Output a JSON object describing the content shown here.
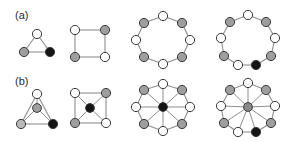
{
  "figure": {
    "width": 304,
    "height": 142,
    "background": "#ffffff",
    "row_labels": [
      {
        "id": "label-a",
        "text": "(a)"
      },
      {
        "id": "label-b",
        "text": "(b)"
      }
    ],
    "colors": {
      "node_white": "#ffffff",
      "node_gray": "#9e9e9e",
      "node_light_gray": "#b9b9b9",
      "node_black": "#151515",
      "hub_gray": "#8a8a8a",
      "edge": "#8e8e8e",
      "node_outline": "#3a3a3a",
      "label_text": "#2b2b2b"
    },
    "node_radius": 4.6,
    "hub_radius": 4.4
  },
  "panels": [
    {
      "name": "row-a-triangle",
      "row": "a",
      "index": 1,
      "graph_type": "cycle",
      "node_count": 3,
      "has_hub": false,
      "nodes": [
        {
          "id": "a1-n1",
          "x": 37,
          "y": 34,
          "fill": "node_white"
        },
        {
          "id": "a1-n2",
          "x": 24,
          "y": 52,
          "fill": "node_gray"
        },
        {
          "id": "a1-n3",
          "x": 50,
          "y": 52,
          "fill": "node_black"
        }
      ],
      "edges": [
        [
          0,
          1
        ],
        [
          1,
          2
        ],
        [
          2,
          0
        ]
      ]
    },
    {
      "name": "row-a-square",
      "row": "a",
      "index": 2,
      "graph_type": "cycle",
      "node_count": 4,
      "has_hub": false,
      "nodes": [
        {
          "id": "a2-n1",
          "x": 75,
          "y": 30,
          "fill": "node_white"
        },
        {
          "id": "a2-n2",
          "x": 105,
          "y": 30,
          "fill": "node_gray"
        },
        {
          "id": "a2-n3",
          "x": 105,
          "y": 57,
          "fill": "node_white"
        },
        {
          "id": "a2-n4",
          "x": 75,
          "y": 57,
          "fill": "node_gray"
        }
      ],
      "edges": [
        [
          0,
          1
        ],
        [
          1,
          2
        ],
        [
          2,
          3
        ],
        [
          3,
          0
        ]
      ]
    },
    {
      "name": "row-a-ring8",
      "row": "a",
      "index": 3,
      "graph_type": "cycle",
      "node_count": 8,
      "has_hub": false,
      "center": {
        "x": 163,
        "y": 40
      },
      "radius_x": 27,
      "radius_y": 24,
      "start_angle_deg": -90,
      "nodes": [
        {
          "id": "a3-n1",
          "x": 163,
          "y": 16,
          "fill": "node_white"
        },
        {
          "id": "a3-n2",
          "x": 182,
          "y": 23,
          "fill": "node_gray"
        },
        {
          "id": "a3-n3",
          "x": 190,
          "y": 40,
          "fill": "node_white"
        },
        {
          "id": "a3-n4",
          "x": 182,
          "y": 57,
          "fill": "node_gray"
        },
        {
          "id": "a3-n5",
          "x": 163,
          "y": 64,
          "fill": "node_white"
        },
        {
          "id": "a3-n6",
          "x": 144,
          "y": 57,
          "fill": "node_gray"
        },
        {
          "id": "a3-n7",
          "x": 136,
          "y": 40,
          "fill": "node_white"
        },
        {
          "id": "a3-n8",
          "x": 144,
          "y": 23,
          "fill": "node_gray"
        }
      ],
      "edges": [
        [
          0,
          1
        ],
        [
          1,
          2
        ],
        [
          2,
          3
        ],
        [
          3,
          4
        ],
        [
          4,
          5
        ],
        [
          5,
          6
        ],
        [
          6,
          7
        ],
        [
          7,
          0
        ]
      ]
    },
    {
      "name": "row-a-ring9",
      "row": "a",
      "index": 4,
      "graph_type": "cycle",
      "node_count": 9,
      "has_hub": false,
      "center": {
        "x": 248,
        "y": 40
      },
      "radius_x": 28,
      "radius_y": 25,
      "nodes": [
        {
          "id": "a4-n1",
          "x": 248,
          "y": 15,
          "fill": "node_white"
        },
        {
          "id": "a4-n2",
          "x": 266,
          "y": 22,
          "fill": "node_gray"
        },
        {
          "id": "a4-n3",
          "x": 275,
          "y": 38,
          "fill": "node_white"
        },
        {
          "id": "a4-n4",
          "x": 271,
          "y": 56,
          "fill": "node_gray"
        },
        {
          "id": "a4-n5",
          "x": 256,
          "y": 65,
          "fill": "node_black"
        },
        {
          "id": "a4-n6",
          "x": 238,
          "y": 65,
          "fill": "node_white"
        },
        {
          "id": "a4-n7",
          "x": 224,
          "y": 56,
          "fill": "node_gray"
        },
        {
          "id": "a4-n8",
          "x": 221,
          "y": 38,
          "fill": "node_white"
        },
        {
          "id": "a4-n9",
          "x": 230,
          "y": 22,
          "fill": "node_gray"
        }
      ],
      "edges": [
        [
          0,
          1
        ],
        [
          1,
          2
        ],
        [
          2,
          3
        ],
        [
          3,
          4
        ],
        [
          4,
          5
        ],
        [
          5,
          6
        ],
        [
          6,
          7
        ],
        [
          7,
          8
        ],
        [
          8,
          0
        ]
      ]
    },
    {
      "name": "row-b-triangle-hub",
      "row": "b",
      "index": 1,
      "graph_type": "wheel",
      "node_count": 3,
      "has_hub": true,
      "hub": {
        "id": "b1-hub",
        "x": 37,
        "y": 108,
        "fill": "node_gray"
      },
      "nodes": [
        {
          "id": "b1-n1",
          "x": 37,
          "y": 94,
          "fill": "node_white"
        },
        {
          "id": "b1-n2",
          "x": 21,
          "y": 124,
          "fill": "node_light_gray"
        },
        {
          "id": "b1-n3",
          "x": 53,
          "y": 124,
          "fill": "node_black"
        }
      ],
      "edges": [
        [
          0,
          1
        ],
        [
          1,
          2
        ],
        [
          2,
          0
        ]
      ]
    },
    {
      "name": "row-b-square-hub",
      "row": "b",
      "index": 2,
      "graph_type": "wheel",
      "node_count": 4,
      "has_hub": true,
      "hub": {
        "id": "b2-hub",
        "x": 90,
        "y": 108,
        "fill": "node_black"
      },
      "nodes": [
        {
          "id": "b2-n1",
          "x": 75,
          "y": 93,
          "fill": "node_white"
        },
        {
          "id": "b2-n2",
          "x": 106,
          "y": 93,
          "fill": "node_gray"
        },
        {
          "id": "b2-n3",
          "x": 106,
          "y": 123,
          "fill": "node_white"
        },
        {
          "id": "b2-n4",
          "x": 75,
          "y": 123,
          "fill": "node_gray"
        }
      ],
      "edges": [
        [
          0,
          1
        ],
        [
          1,
          2
        ],
        [
          2,
          3
        ],
        [
          3,
          0
        ]
      ]
    },
    {
      "name": "row-b-wheel8",
      "row": "b",
      "index": 3,
      "graph_type": "wheel",
      "node_count": 8,
      "has_hub": true,
      "hub": {
        "id": "b3-hub",
        "x": 163,
        "y": 107,
        "fill": "node_black"
      },
      "nodes": [
        {
          "id": "b3-n1",
          "x": 163,
          "y": 84,
          "fill": "node_white"
        },
        {
          "id": "b3-n2",
          "x": 182,
          "y": 90,
          "fill": "node_gray"
        },
        {
          "id": "b3-n3",
          "x": 190,
          "y": 107,
          "fill": "node_white"
        },
        {
          "id": "b3-n4",
          "x": 182,
          "y": 124,
          "fill": "node_gray"
        },
        {
          "id": "b3-n5",
          "x": 163,
          "y": 131,
          "fill": "node_white"
        },
        {
          "id": "b3-n6",
          "x": 144,
          "y": 124,
          "fill": "node_gray"
        },
        {
          "id": "b3-n7",
          "x": 136,
          "y": 107,
          "fill": "node_white"
        },
        {
          "id": "b3-n8",
          "x": 144,
          "y": 90,
          "fill": "node_gray"
        }
      ],
      "edges": [
        [
          0,
          1
        ],
        [
          1,
          2
        ],
        [
          2,
          3
        ],
        [
          3,
          4
        ],
        [
          4,
          5
        ],
        [
          5,
          6
        ],
        [
          6,
          7
        ],
        [
          7,
          0
        ]
      ]
    },
    {
      "name": "row-b-wheel9",
      "row": "b",
      "index": 4,
      "graph_type": "wheel",
      "node_count": 9,
      "has_hub": true,
      "hub": {
        "id": "b4-hub",
        "x": 248,
        "y": 107,
        "fill": "hub_gray"
      },
      "nodes": [
        {
          "id": "b4-n1",
          "x": 248,
          "y": 83,
          "fill": "node_white"
        },
        {
          "id": "b4-n2",
          "x": 266,
          "y": 90,
          "fill": "node_gray"
        },
        {
          "id": "b4-n3",
          "x": 275,
          "y": 106,
          "fill": "node_white"
        },
        {
          "id": "b4-n4",
          "x": 271,
          "y": 123,
          "fill": "node_gray"
        },
        {
          "id": "b4-n5",
          "x": 256,
          "y": 132,
          "fill": "node_black"
        },
        {
          "id": "b4-n6",
          "x": 238,
          "y": 132,
          "fill": "node_white"
        },
        {
          "id": "b4-n7",
          "x": 224,
          "y": 123,
          "fill": "node_gray"
        },
        {
          "id": "b4-n8",
          "x": 221,
          "y": 106,
          "fill": "node_white"
        },
        {
          "id": "b4-n9",
          "x": 230,
          "y": 90,
          "fill": "node_gray"
        }
      ],
      "edges": [
        [
          0,
          1
        ],
        [
          1,
          2
        ],
        [
          2,
          3
        ],
        [
          3,
          4
        ],
        [
          4,
          5
        ],
        [
          5,
          6
        ],
        [
          6,
          7
        ],
        [
          7,
          8
        ],
        [
          8,
          0
        ]
      ]
    }
  ]
}
